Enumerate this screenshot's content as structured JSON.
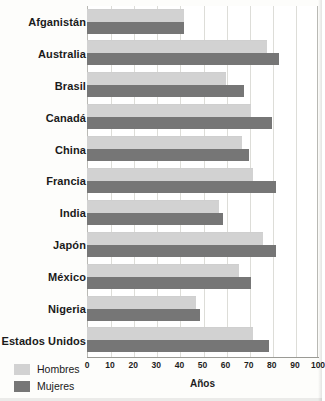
{
  "chart_data": {
    "type": "bar",
    "orientation": "horizontal",
    "title": "",
    "xlabel": "Años",
    "ylabel": "",
    "xlim": [
      0,
      100
    ],
    "xticks": [
      0,
      10,
      20,
      30,
      40,
      50,
      60,
      70,
      80,
      90,
      100
    ],
    "grid": true,
    "grid_axis": "x",
    "legend_position": "bottom-left",
    "categories": [
      "Afganistán",
      "Australia",
      "Brasil",
      "Canadá",
      "China",
      "Francia",
      "India",
      "Japón",
      "México",
      "Nigeria",
      "Estados Unidos"
    ],
    "series": [
      {
        "name": "Hombres",
        "color": "#d2d2d2",
        "values": [
          42,
          78,
          60,
          71,
          67,
          72,
          57,
          76,
          66,
          47,
          72
        ]
      },
      {
        "name": "Mujeres",
        "color": "#767676",
        "values": [
          42,
          83,
          68,
          80,
          70,
          82,
          59,
          82,
          71,
          49,
          79
        ]
      }
    ]
  },
  "legend": {
    "items": [
      {
        "label": "Hombres",
        "color": "#d2d2d2"
      },
      {
        "label": "Mujeres",
        "color": "#767676"
      }
    ]
  }
}
